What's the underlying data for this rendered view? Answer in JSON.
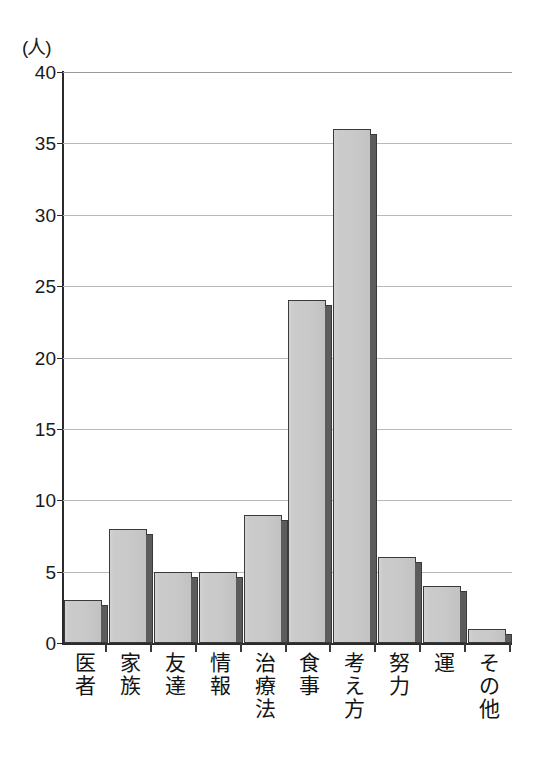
{
  "chart_data": {
    "type": "bar",
    "title": "",
    "subtitle": "",
    "xlabel": "",
    "ylabel": "(人)",
    "unit_caption": "(人)",
    "categories": [
      "医者",
      "家族",
      "友達",
      "情報",
      "治療法",
      "食事",
      "考え方",
      "努力",
      "運",
      "その他"
    ],
    "values": [
      3,
      8,
      5,
      5,
      9,
      24,
      36,
      6,
      4,
      1
    ],
    "ylim": [
      0,
      40
    ],
    "ytick_step": 5,
    "yticks": [
      40,
      35,
      30,
      25,
      20,
      15,
      10,
      5,
      0
    ],
    "ytick_labels": [
      "40",
      "35",
      "30",
      "25",
      "20",
      "15",
      "10",
      "5",
      "0"
    ],
    "grid": true,
    "grid_axis": "y",
    "legend": false,
    "legend_position": "none",
    "bar_fill_color": "#c9c9c9",
    "bar_edge_color": "#3a3a3a",
    "bar_side_color": "#5c5c5c",
    "gridline_color": "#b9b9b9",
    "axis_color": "#2b2b2b",
    "background_color": "#ffffff",
    "style": "3d-shadowed-bars"
  }
}
